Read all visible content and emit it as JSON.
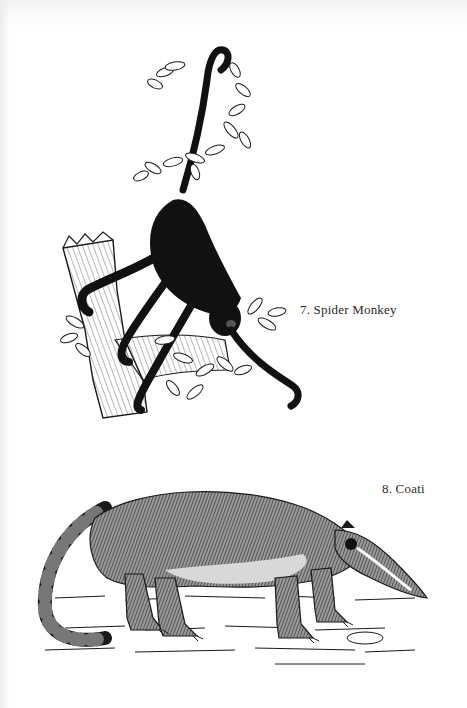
{
  "page": {
    "background": "#ffffff",
    "ink_color": "#1a1a1a"
  },
  "plates": [
    {
      "number": "7.",
      "name": "Spider Monkey",
      "caption": "7. Spider Monkey",
      "illustration": "spider-monkey-hanging-from-branch"
    },
    {
      "number": "8.",
      "name": "Coati",
      "caption": "8. Coati",
      "illustration": "coati-walking-on-ground"
    }
  ]
}
